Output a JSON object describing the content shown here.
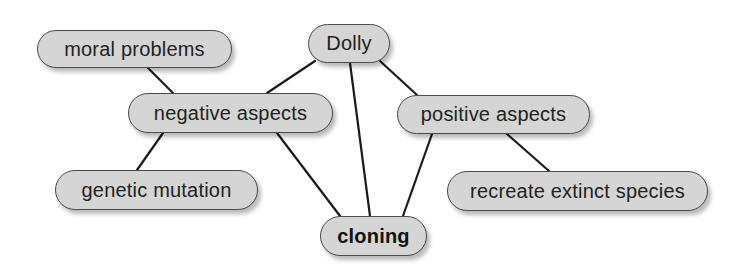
{
  "diagram": {
    "type": "concept-map",
    "nodes": [
      {
        "id": "moral_problems",
        "label": "moral problems",
        "bold": false
      },
      {
        "id": "dolly",
        "label": "Dolly",
        "bold": false
      },
      {
        "id": "negative_aspects",
        "label": "negative aspects",
        "bold": false
      },
      {
        "id": "positive_aspects",
        "label": "positive aspects",
        "bold": false
      },
      {
        "id": "genetic_mutation",
        "label": "genetic mutation",
        "bold": false
      },
      {
        "id": "recreate_extinct_species",
        "label": "recreate extinct species",
        "bold": false
      },
      {
        "id": "cloning",
        "label": "cloning",
        "bold": true
      }
    ],
    "edges": [
      {
        "from": "moral_problems",
        "to": "negative_aspects"
      },
      {
        "from": "negative_aspects",
        "to": "genetic_mutation"
      },
      {
        "from": "negative_aspects",
        "to": "cloning"
      },
      {
        "from": "dolly",
        "to": "negative_aspects"
      },
      {
        "from": "dolly",
        "to": "cloning"
      },
      {
        "from": "dolly",
        "to": "positive_aspects"
      },
      {
        "from": "positive_aspects",
        "to": "cloning"
      },
      {
        "from": "positive_aspects",
        "to": "recreate_extinct_species"
      }
    ],
    "colors": {
      "node_fill": "#d5d5d5",
      "node_border": "#4a4a4a",
      "edge": "#1a1a1a",
      "text": "#222222"
    }
  }
}
